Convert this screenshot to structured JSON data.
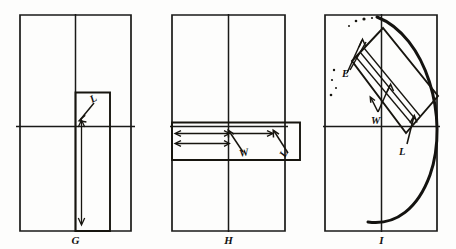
{
  "figure": {
    "background_color": "#fdfdfc",
    "ink_color": "#17150f",
    "panels": [
      {
        "id": "G",
        "caption": "G",
        "description": "Upright rectangular frame with crosshair; narrow vertical patch at center-right with a downward length dimension arrow",
        "labels": [
          {
            "name": "L",
            "text": "L",
            "meaning": "length"
          }
        ]
      },
      {
        "id": "H",
        "caption": "H",
        "description": "Upright rectangular frame with crosshair; horizontal band crossing the center line extending past the right edge, with two horizontal dimension arrows",
        "labels": [
          {
            "name": "W",
            "text": "W",
            "meaning": "width"
          },
          {
            "name": "L",
            "text": "L",
            "meaning": "length"
          }
        ]
      },
      {
        "id": "I",
        "caption": "I",
        "description": "Upright rectangular frame with crosshair; diagonal rectangle running from upper-left to lower-right overlaid with a large bowed arc, with edge, width and length callouts",
        "labels": [
          {
            "name": "E",
            "text": "E",
            "meaning": "edge"
          },
          {
            "name": "W",
            "text": "W",
            "meaning": "width"
          },
          {
            "name": "L",
            "text": "L",
            "meaning": "length"
          }
        ]
      }
    ]
  }
}
